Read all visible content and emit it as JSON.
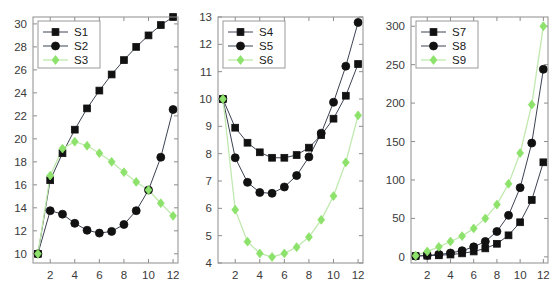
{
  "figure": {
    "background_color": "#ffffff",
    "panel_count": 3,
    "axis_color": "#8d8d8d",
    "dark_series_color": "#111111",
    "dark_line_color": "#3b4252",
    "green_series_color": "#8ce26a",
    "green_line_color": "#bfe9ae"
  },
  "chart_data": [
    {
      "type": "line",
      "title": "",
      "xlabel": "",
      "ylabel": "",
      "x": [
        1,
        2,
        3,
        4,
        5,
        6,
        7,
        8,
        9,
        10,
        11,
        12
      ],
      "xlim": [
        0.6,
        12.4
      ],
      "ylim": [
        9.2,
        30.6
      ],
      "xticks": [
        2,
        4,
        6,
        8,
        10,
        12
      ],
      "yticks": [
        10,
        12,
        14,
        16,
        18,
        20,
        22,
        24,
        26,
        28,
        30
      ],
      "grid": false,
      "legend_position": "upper-left",
      "series": [
        {
          "name": "S1",
          "marker": "square",
          "color": "#111111",
          "values": [
            10.0,
            16.4,
            18.75,
            20.8,
            22.65,
            24.2,
            25.6,
            26.85,
            28.0,
            29.0,
            29.9,
            30.6
          ]
        },
        {
          "name": "S2",
          "marker": "circle",
          "color": "#111111",
          "values": [
            10.0,
            13.75,
            13.45,
            12.65,
            12.05,
            11.8,
            11.95,
            12.55,
            13.75,
            15.55,
            18.4,
            22.55
          ]
        },
        {
          "name": "S3",
          "marker": "diamond",
          "color": "#8ce26a",
          "values": [
            10.0,
            16.8,
            19.15,
            19.75,
            19.4,
            18.75,
            18.0,
            17.1,
            16.25,
            15.55,
            14.4,
            13.3
          ]
        }
      ]
    },
    {
      "type": "line",
      "title": "",
      "xlabel": "",
      "ylabel": "",
      "x": [
        1,
        2,
        3,
        4,
        5,
        6,
        7,
        8,
        9,
        10,
        11,
        12
      ],
      "xlim": [
        0.6,
        12.4
      ],
      "ylim": [
        4.0,
        13.0
      ],
      "xticks": [
        2,
        4,
        6,
        8,
        10,
        12
      ],
      "yticks": [
        4,
        5,
        6,
        7,
        8,
        9,
        10,
        11,
        12,
        13
      ],
      "grid": false,
      "legend_position": "upper-left",
      "series": [
        {
          "name": "S4",
          "marker": "square",
          "color": "#111111",
          "values": [
            10.0,
            8.95,
            8.4,
            8.05,
            7.85,
            7.85,
            7.95,
            8.22,
            8.68,
            9.28,
            10.12,
            11.28
          ]
        },
        {
          "name": "S5",
          "marker": "circle",
          "color": "#111111",
          "values": [
            10.0,
            7.85,
            6.95,
            6.58,
            6.55,
            6.78,
            7.2,
            7.88,
            8.75,
            9.88,
            11.2,
            12.8
          ]
        },
        {
          "name": "S6",
          "marker": "diamond",
          "color": "#8ce26a",
          "values": [
            10.0,
            5.95,
            4.78,
            4.35,
            4.22,
            4.35,
            4.58,
            4.95,
            5.58,
            6.45,
            7.68,
            9.4
          ]
        }
      ]
    },
    {
      "type": "line",
      "title": "",
      "xlabel": "",
      "ylabel": "",
      "x": [
        1,
        2,
        3,
        4,
        5,
        6,
        7,
        8,
        9,
        10,
        11,
        12
      ],
      "xlim": [
        0.6,
        12.4
      ],
      "ylim": [
        -8,
        312
      ],
      "xticks": [
        2,
        4,
        6,
        8,
        10,
        12
      ],
      "yticks": [
        0,
        50,
        100,
        150,
        200,
        250,
        300
      ],
      "grid": false,
      "legend_position": "upper-left",
      "series": [
        {
          "name": "S7",
          "marker": "square",
          "color": "#111111",
          "values": [
            1.0,
            1.5,
            2.0,
            3.0,
            4.5,
            7.0,
            11.0,
            17.0,
            28.0,
            45.0,
            74.0,
            123.0
          ]
        },
        {
          "name": "S8",
          "marker": "circle",
          "color": "#111111",
          "values": [
            1.0,
            2.0,
            3.0,
            5.0,
            8.0,
            13.0,
            20.0,
            33.0,
            54.0,
            90.0,
            148.0,
            244.0
          ]
        },
        {
          "name": "S9",
          "marker": "diamond",
          "color": "#8ce26a",
          "values": [
            1.5,
            7.0,
            13.0,
            20.0,
            27.0,
            37.0,
            50.0,
            68.0,
            95.0,
            135.0,
            198.0,
            300.0
          ]
        }
      ]
    }
  ]
}
